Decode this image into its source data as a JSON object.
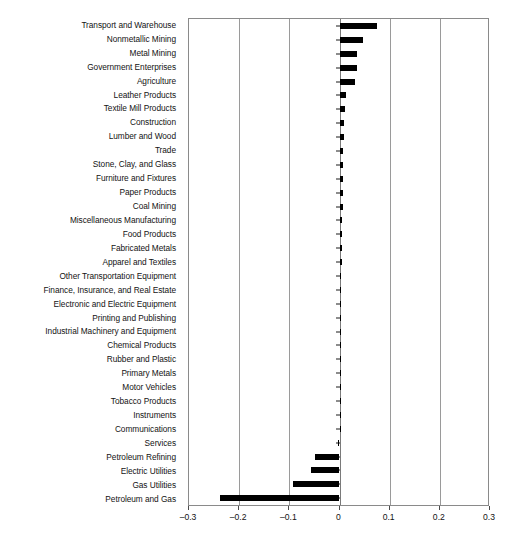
{
  "chart_data": {
    "type": "bar",
    "orientation": "horizontal",
    "title": "",
    "xlabel": "",
    "ylabel": "",
    "xlim": [
      -0.3,
      0.3
    ],
    "xticks": [
      -0.3,
      -0.2,
      -0.1,
      0,
      0.1,
      0.2,
      0.3
    ],
    "xtick_labels": [
      "–0.3",
      "–0.2",
      "–0.1",
      "0",
      "0.1",
      "0.2",
      "0.3"
    ],
    "grid": true,
    "legend": null,
    "bar_color": "#000000",
    "categories": [
      "Transport and Warehouse",
      "Nonmetallic Mining",
      "Metal Mining",
      "Government Enterprises",
      "Agriculture",
      "Leather Products",
      "Textile Mill Products",
      "Construction",
      "Lumber and Wood",
      "Trade",
      "Stone, Clay, and Glass",
      "Furniture and Fixtures",
      "Paper Products",
      "Coal Mining",
      "Miscellaneous Manufacturing",
      "Food Products",
      "Fabricated Metals",
      "Apparel and Textiles",
      "Other Transportation Equipment",
      "Finance, Insurance, and Real Estate",
      "Electronic and Electric Equipment",
      "Printing and Publishing",
      "Industrial Machinery and Equipment",
      "Chemical Products",
      "Rubber and Plastic",
      "Primary Metals",
      "Motor Vehicles",
      "Tobacco Products",
      "Instruments",
      "Communications",
      "Services",
      "Petroleum Refining",
      "Electric Utilities",
      "Gas Utilities",
      "Petroleum and Gas"
    ],
    "values": [
      0.075,
      0.047,
      0.035,
      0.035,
      0.03,
      0.012,
      0.011,
      0.009,
      0.008,
      0.007,
      0.007,
      0.006,
      0.006,
      0.006,
      0.005,
      0.005,
      0.005,
      0.004,
      0.003,
      0.003,
      0.003,
      0.002,
      0.002,
      0.002,
      0.002,
      0.001,
      0.001,
      0.001,
      0.001,
      0.0,
      -0.002,
      -0.048,
      -0.056,
      -0.093,
      -0.238
    ]
  }
}
